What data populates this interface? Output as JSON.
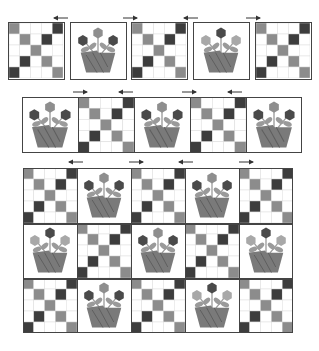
{
  "diagram": {
    "colors": {
      "dark": "#3d3d3d",
      "mid": "#8c8c8c",
      "light": "#ffffff",
      "grid_line": "#d8d8d8",
      "border": "#444444",
      "petal_dark": "#4a4a4a",
      "petal_mid": "#8e8e8e",
      "petal_light": "#a8a8a8",
      "leaf": "#9a9a9a",
      "basket": "#7a7a7a",
      "basket_stripe": "#5e5e5e",
      "arrow": "#333333"
    },
    "checker_pattern": [
      [
        "mid",
        "light",
        "light",
        "light",
        "dark"
      ],
      [
        "light",
        "mid",
        "light",
        "dark",
        "light"
      ],
      [
        "light",
        "light",
        "mid",
        "light",
        "light"
      ],
      [
        "light",
        "dark",
        "light",
        "mid",
        "light"
      ],
      [
        "dark",
        "light",
        "light",
        "light",
        "mid"
      ]
    ],
    "step1_blocks": [
      "checker",
      "flower-a",
      "checker",
      "flower-b",
      "checker"
    ],
    "step1_arrows": [
      "left",
      "right",
      "left",
      "right"
    ],
    "step2_blocks": [
      "flower-a",
      "checker",
      "flower-a",
      "checker",
      "flower-a"
    ],
    "step2_arrows": [
      "right",
      "left",
      "right",
      "left"
    ],
    "quilt_rows": [
      [
        "checker",
        "flower-a",
        "checker",
        "flower-a",
        "checker"
      ],
      [
        "flower-b",
        "checker",
        "flower-a",
        "checker",
        "flower-b"
      ],
      [
        "checker",
        "flower-a",
        "checker",
        "flower-b",
        "checker"
      ]
    ],
    "quilt_arrows": [
      "left",
      "right",
      "left",
      "right"
    ]
  }
}
